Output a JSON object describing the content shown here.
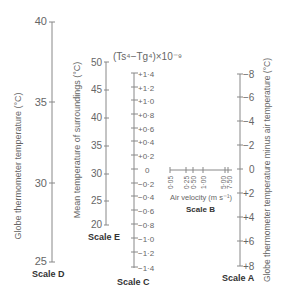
{
  "scale_d": {
    "name": "Scale D",
    "title": "Globe thermometer temperature (°C)",
    "ticks": [
      "40",
      "35",
      "30",
      "25"
    ]
  },
  "scale_e": {
    "name": "Scale E",
    "title": "Mean temperature of surroundings (°C)",
    "ticks": [
      "50",
      "45",
      "40",
      "35",
      "30",
      "25",
      "20"
    ]
  },
  "scale_c": {
    "name": "Scale C",
    "title": "(Ts⁴−Tg⁴)×10⁻⁹",
    "ticks": [
      "+1·4",
      "+1·2",
      "+1·0",
      "+0·8",
      "+0·6",
      "+0·4",
      "+0·2",
      "0",
      "−0·2",
      "−0·4",
      "−0·6",
      "−0·8",
      "−1·0",
      "−1·2",
      "−1·4"
    ]
  },
  "scale_b": {
    "name": "Scale B",
    "title": "Air velocity (m s⁻¹)",
    "ticks": [
      "0·05",
      "0·25",
      "0·50",
      "1·00",
      "5·00",
      "7·50"
    ]
  },
  "scale_a": {
    "name": "Scale A",
    "title": "Globe thermometer temperature minus air temperature (°C)",
    "ticks": [
      "−8",
      "−6",
      "−4",
      "−2",
      "0",
      "+2",
      "+4",
      "+6",
      "+8"
    ]
  }
}
